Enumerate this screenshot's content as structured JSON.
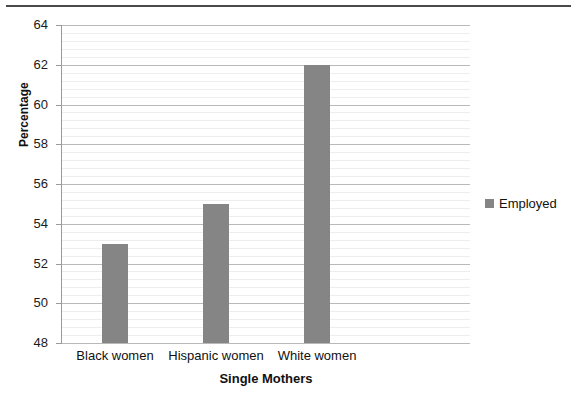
{
  "figure": {
    "width": 577,
    "height": 415,
    "background": "#ffffff",
    "top_rule_color": "#4a4a4a"
  },
  "chart_data": {
    "type": "bar",
    "title": "",
    "subtitle": "",
    "categories": [
      "Black women",
      "Hispanic women",
      "White women"
    ],
    "values": [
      53,
      55,
      62
    ],
    "series": [
      {
        "name": "Employed",
        "values": [
          53,
          55,
          62
        ],
        "color": "#858585"
      }
    ],
    "xlabel": "Single Mothers",
    "ylabel": "Percentage",
    "ylim": [
      48,
      64
    ],
    "ytick_step": 2,
    "yticks": [
      48,
      50,
      52,
      54,
      56,
      58,
      60,
      62,
      64
    ],
    "ytick_labels": [
      "48",
      "50",
      "52",
      "54",
      "56",
      "58",
      "60",
      "62",
      "64"
    ],
    "minor_gridlines_per_major": 5,
    "grid": true,
    "grid_major_color": "#b9b9b9",
    "grid_minor_color": "#ededed",
    "legend_position": "right",
    "legend_entries": [
      "Employed"
    ],
    "annotations": []
  },
  "axes": {
    "y_axis_title": "Percentage",
    "x_axis_title": "Single Mothers",
    "y_axis_line_color": "#9a9a9a"
  },
  "legend": {
    "swatch_color": "#858585",
    "label": "Employed"
  }
}
